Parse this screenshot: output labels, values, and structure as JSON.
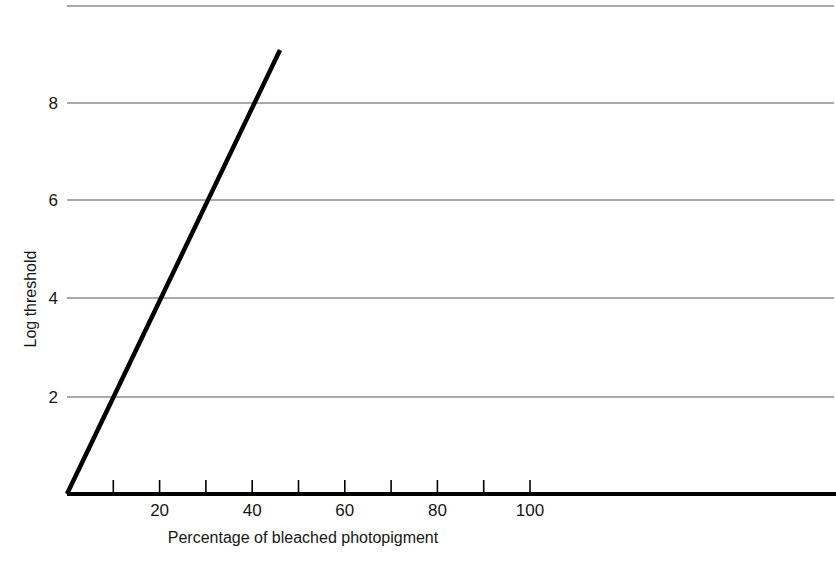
{
  "chart_data": {
    "type": "line",
    "title": "",
    "subtitle": "",
    "xlabel": "Percentage of bleached photopigment",
    "ylabel": "Log threshold",
    "xlim": [
      0,
      165
    ],
    "ylim": [
      0,
      10
    ],
    "grid": "horizontal",
    "legend": "none",
    "x_ticks": [
      0,
      10,
      20,
      30,
      40,
      50,
      60,
      70,
      80,
      90,
      100
    ],
    "x_tick_labels": [
      "",
      "",
      "20",
      "",
      "40",
      "",
      "60",
      "",
      "80",
      "",
      "100"
    ],
    "y_ticks": [
      2,
      4,
      6,
      8,
      10
    ],
    "y_tick_labels": [
      "2",
      "4",
      "6",
      "8",
      ""
    ],
    "gridlines_y": [
      2,
      4,
      6,
      8,
      10
    ],
    "series": [
      {
        "name": "Threshold elevation",
        "color": "#000000",
        "line_width": 4,
        "x": [
          0,
          46
        ],
        "y": [
          0,
          9.1
        ]
      }
    ],
    "annotations": []
  },
  "axes": {
    "x_axis_label": "Percentage of bleached photopigment",
    "y_axis_label": "Log threshold",
    "x_tick_labels": [
      {
        "value": 20,
        "label": "20"
      },
      {
        "value": 40,
        "label": "40"
      },
      {
        "value": 60,
        "label": "60"
      },
      {
        "value": 80,
        "label": "80"
      },
      {
        "value": 100,
        "label": "100"
      }
    ],
    "y_tick_labels": [
      {
        "value": 8,
        "label": "8"
      },
      {
        "value": 6,
        "label": "6"
      },
      {
        "value": 4,
        "label": "4"
      },
      {
        "value": 2,
        "label": "2"
      }
    ]
  },
  "colors": {
    "background": "#ffffff",
    "gridline": "#8c8c8c",
    "axis": "#000000",
    "data_line": "#000000",
    "text": "#161616"
  }
}
